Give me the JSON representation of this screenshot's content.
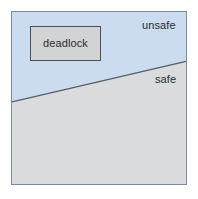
{
  "diagram": {
    "frame": {
      "border_color": "#7b8a9d"
    },
    "regions": [
      {
        "id": "unsafe",
        "label": "unsafe",
        "fill": "#cbdbf0"
      },
      {
        "id": "safe",
        "label": "safe",
        "fill": "#d9dbdd"
      }
    ],
    "boundary": {
      "name": "safe-unsafe-boundary",
      "color": "#555b61",
      "start": [
        0,
        91
      ],
      "end": [
        176,
        50
      ]
    },
    "deadlock_box": {
      "label": "deadlock",
      "fill": "#d1d3d5",
      "border_color": "#4a4f55"
    },
    "labels": {
      "unsafe": "unsafe",
      "safe": "safe",
      "deadlock": "deadlock"
    }
  }
}
